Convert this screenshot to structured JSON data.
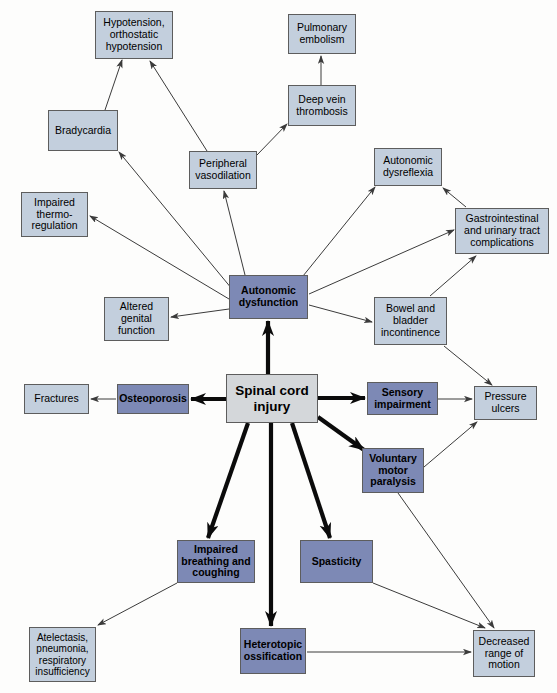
{
  "diagram": {
    "colors": {
      "light_node": "#c3cfdd",
      "dark_node": "#7d89b5",
      "primary_node": "#d4d7da",
      "border": "#5d5d5d",
      "edge": "#3b3b3b",
      "background": "#fdfdfc"
    },
    "nodes": [
      {
        "id": "hypotension",
        "label": "Hypotension,\northostatic\nhypotension",
        "style": "light",
        "x": 95,
        "y": 11,
        "w": 78,
        "h": 48,
        "font": 10.5
      },
      {
        "id": "pulmonary-embolism",
        "label": "Pulmonary\nembolism",
        "style": "light",
        "x": 288,
        "y": 14,
        "w": 68,
        "h": 40,
        "font": 10.5
      },
      {
        "id": "deep-vein-thrombosis",
        "label": "Deep vein\nthrombosis",
        "style": "light",
        "x": 288,
        "y": 85,
        "w": 68,
        "h": 41,
        "font": 10.5
      },
      {
        "id": "bradycardia",
        "label": "Bradycardia",
        "style": "light",
        "x": 48,
        "y": 110,
        "w": 70,
        "h": 41,
        "font": 10.5
      },
      {
        "id": "peripheral-vasodilation",
        "label": "Peripheral\nvasodilation",
        "style": "light",
        "x": 189,
        "y": 151,
        "w": 68,
        "h": 38,
        "font": 10.5
      },
      {
        "id": "autonomic-dysreflexia",
        "label": "Autonomic\ndysreflexia",
        "style": "light",
        "x": 374,
        "y": 148,
        "w": 68,
        "h": 38,
        "font": 10.5
      },
      {
        "id": "gastrointestinal-urinary",
        "label": "Gastrointestinal\nand urinary tract\ncomplications",
        "style": "light",
        "x": 455,
        "y": 208,
        "w": 94,
        "h": 46,
        "font": 10.5
      },
      {
        "id": "impaired-thermoregulation",
        "label": "Impaired\nthermo-\nregulation",
        "style": "light",
        "x": 21,
        "y": 192,
        "w": 67,
        "h": 45,
        "font": 10.5
      },
      {
        "id": "autonomic-dysfunction",
        "label": "Autonomic\ndysfunction",
        "style": "dark",
        "x": 229,
        "y": 275,
        "w": 79,
        "h": 44,
        "font": 10.5
      },
      {
        "id": "altered-genital-function",
        "label": "Altered\ngenital\nfunction",
        "style": "light",
        "x": 104,
        "y": 297,
        "w": 65,
        "h": 44,
        "font": 10.5
      },
      {
        "id": "bowel-bladder-incontinence",
        "label": "Bowel and\nbladder\nincontinence",
        "style": "light",
        "x": 374,
        "y": 297,
        "w": 73,
        "h": 48,
        "font": 10.5
      },
      {
        "id": "fractures",
        "label": "Fractures",
        "style": "light",
        "x": 24,
        "y": 384,
        "w": 65,
        "h": 30,
        "font": 10.5
      },
      {
        "id": "osteoporosis",
        "label": "Osteoporosis",
        "style": "dark",
        "x": 117,
        "y": 384,
        "w": 72,
        "h": 30,
        "font": 10.5
      },
      {
        "id": "spinal-cord-injury",
        "label": "Spinal cord\ninjury",
        "style": "primary",
        "x": 226,
        "y": 374,
        "w": 92,
        "h": 49,
        "font": 13.5
      },
      {
        "id": "sensory-impairment",
        "label": "Sensory\nimpairment",
        "style": "dark",
        "x": 367,
        "y": 382,
        "w": 71,
        "h": 33,
        "font": 10.5
      },
      {
        "id": "pressure-ulcers",
        "label": "Pressure\nulcers",
        "style": "light",
        "x": 474,
        "y": 386,
        "w": 63,
        "h": 34,
        "font": 10.5
      },
      {
        "id": "voluntary-motor-paralysis",
        "label": "Voluntary\nmotor\nparalysis",
        "style": "dark",
        "x": 362,
        "y": 448,
        "w": 62,
        "h": 45,
        "font": 10.5
      },
      {
        "id": "impaired-breathing",
        "label": "Impaired\nbreathing and\ncoughing",
        "style": "dark",
        "x": 177,
        "y": 540,
        "w": 78,
        "h": 43,
        "font": 10.5
      },
      {
        "id": "spasticity",
        "label": "Spasticity",
        "style": "dark",
        "x": 300,
        "y": 540,
        "w": 73,
        "h": 43,
        "font": 10.5
      },
      {
        "id": "heterotopic-ossification",
        "label": "Heterotopic\nossification",
        "style": "dark",
        "x": 240,
        "y": 628,
        "w": 66,
        "h": 46,
        "font": 10.5
      },
      {
        "id": "atelectasis",
        "label": "Atelectasis,\npneumonia,\nrespiratory\ninsufficiency",
        "style": "light",
        "x": 29,
        "y": 627,
        "w": 67,
        "h": 55,
        "font": 10
      },
      {
        "id": "decreased-range-of-motion",
        "label": "Decreased\nrange of\nmotion",
        "style": "light",
        "x": 473,
        "y": 630,
        "w": 62,
        "h": 47,
        "font": 10.5
      }
    ],
    "edges": [
      {
        "from": "bradycardia",
        "to": "hypotension",
        "x1": 105,
        "y1": 110,
        "x2": 122,
        "y2": 60,
        "weight": "thin"
      },
      {
        "from": "peripheral-vasodilation",
        "to": "hypotension",
        "x1": 207,
        "y1": 151,
        "x2": 150,
        "y2": 61,
        "weight": "thin"
      },
      {
        "from": "deep-vein-thrombosis",
        "to": "pulmonary-embolism",
        "x1": 321,
        "y1": 85,
        "x2": 321,
        "y2": 56,
        "weight": "thin"
      },
      {
        "from": "peripheral-vasodilation",
        "to": "deep-vein-thrombosis",
        "x1": 257,
        "y1": 155,
        "x2": 287,
        "y2": 124,
        "weight": "thin"
      },
      {
        "from": "autonomic-dysfunction",
        "to": "peripheral-vasodilation",
        "x1": 245,
        "y1": 275,
        "x2": 224,
        "y2": 191,
        "weight": "thin"
      },
      {
        "from": "autonomic-dysfunction",
        "to": "bradycardia",
        "x1": 232,
        "y1": 289,
        "x2": 119,
        "y2": 152,
        "weight": "thin"
      },
      {
        "from": "autonomic-dysfunction",
        "to": "impaired-thermoregulation",
        "x1": 229,
        "y1": 299,
        "x2": 90,
        "y2": 216,
        "weight": "thin"
      },
      {
        "from": "autonomic-dysfunction",
        "to": "altered-genital-function",
        "x1": 229,
        "y1": 309,
        "x2": 171,
        "y2": 317,
        "weight": "thin"
      },
      {
        "from": "autonomic-dysfunction",
        "to": "autonomic-dysreflexia",
        "x1": 303,
        "y1": 276,
        "x2": 375,
        "y2": 187,
        "weight": "thin"
      },
      {
        "from": "autonomic-dysfunction",
        "to": "gastrointestinal-urinary",
        "x1": 309,
        "y1": 294,
        "x2": 454,
        "y2": 230,
        "weight": "thin"
      },
      {
        "from": "autonomic-dysfunction",
        "to": "bowel-bladder-incontinence",
        "x1": 309,
        "y1": 305,
        "x2": 372,
        "y2": 322,
        "weight": "thin"
      },
      {
        "from": "gastrointestinal-urinary",
        "to": "autonomic-dysreflexia",
        "x1": 466,
        "y1": 207,
        "x2": 443,
        "y2": 188,
        "weight": "thin"
      },
      {
        "from": "bowel-bladder-incontinence",
        "to": "gastrointestinal-urinary",
        "x1": 430,
        "y1": 296,
        "x2": 476,
        "y2": 256,
        "weight": "thin"
      },
      {
        "from": "bowel-bladder-incontinence",
        "to": "pressure-ulcers",
        "x1": 444,
        "y1": 346,
        "x2": 492,
        "y2": 385,
        "weight": "thin"
      },
      {
        "from": "spinal-cord-injury",
        "to": "autonomic-dysfunction",
        "x1": 268,
        "y1": 374,
        "x2": 268,
        "y2": 321,
        "weight": "thick"
      },
      {
        "from": "spinal-cord-injury",
        "to": "osteoporosis",
        "x1": 226,
        "y1": 399,
        "x2": 191,
        "y2": 399,
        "weight": "thick"
      },
      {
        "from": "osteoporosis",
        "to": "fractures",
        "x1": 116,
        "y1": 399,
        "x2": 91,
        "y2": 399,
        "weight": "thin"
      },
      {
        "from": "spinal-cord-injury",
        "to": "sensory-impairment",
        "x1": 318,
        "y1": 398,
        "x2": 365,
        "y2": 398,
        "weight": "thick"
      },
      {
        "from": "sensory-impairment",
        "to": "pressure-ulcers",
        "x1": 438,
        "y1": 399,
        "x2": 472,
        "y2": 399,
        "weight": "thin"
      },
      {
        "from": "spinal-cord-injury",
        "to": "voluntary-motor-paralysis",
        "x1": 318,
        "y1": 417,
        "x2": 364,
        "y2": 450,
        "weight": "thick"
      },
      {
        "from": "voluntary-motor-paralysis",
        "to": "pressure-ulcers",
        "x1": 424,
        "y1": 467,
        "x2": 477,
        "y2": 422,
        "weight": "thin"
      },
      {
        "from": "spinal-cord-injury",
        "to": "impaired-breathing",
        "x1": 248,
        "y1": 423,
        "x2": 208,
        "y2": 538,
        "weight": "thick"
      },
      {
        "from": "spinal-cord-injury",
        "to": "spasticity",
        "x1": 292,
        "y1": 423,
        "x2": 330,
        "y2": 538,
        "weight": "thick"
      },
      {
        "from": "spinal-cord-injury",
        "to": "heterotopic-ossification",
        "x1": 271,
        "y1": 423,
        "x2": 271,
        "y2": 626,
        "weight": "thick"
      },
      {
        "from": "impaired-breathing",
        "to": "atelectasis",
        "x1": 177,
        "y1": 583,
        "x2": 98,
        "y2": 625,
        "weight": "thin"
      },
      {
        "from": "spasticity",
        "to": "decreased-range-of-motion",
        "x1": 373,
        "y1": 583,
        "x2": 485,
        "y2": 628,
        "weight": "thin"
      },
      {
        "from": "heterotopic-ossification",
        "to": "decreased-range-of-motion",
        "x1": 307,
        "y1": 652,
        "x2": 471,
        "y2": 652,
        "weight": "thin"
      },
      {
        "from": "voluntary-motor-paralysis",
        "to": "decreased-range-of-motion",
        "x1": 398,
        "y1": 493,
        "x2": 494,
        "y2": 628,
        "weight": "thin"
      }
    ]
  }
}
